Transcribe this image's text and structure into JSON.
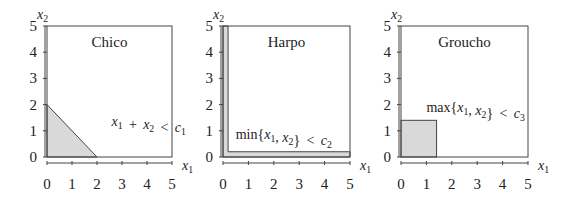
{
  "chart_data": [
    {
      "type": "area",
      "title": "Chico",
      "xlabel": "x1",
      "ylabel": "x2",
      "xlim": [
        0,
        5
      ],
      "ylim": [
        0,
        5
      ],
      "xticks": [
        "0",
        "1",
        "2",
        "3",
        "4",
        "5"
      ],
      "yticks": [
        "0",
        "1",
        "2",
        "3",
        "4",
        "5"
      ],
      "region": {
        "shape": "triangle",
        "points": [
          [
            0,
            0
          ],
          [
            2,
            0
          ],
          [
            0,
            2
          ]
        ]
      },
      "annotation": {
        "text": "x1 + x2 < c1",
        "at": [
          2.5,
          1.2
        ]
      }
    },
    {
      "type": "area",
      "title": "Harpo",
      "xlabel": "x1",
      "ylabel": "x2",
      "xlim": [
        0,
        5
      ],
      "ylim": [
        0,
        5
      ],
      "xticks": [
        "0",
        "1",
        "2",
        "3",
        "4",
        "5"
      ],
      "yticks": [
        "0",
        "1",
        "2",
        "3",
        "4",
        "5"
      ],
      "region": {
        "shape": "L-band",
        "thickness": 0.2
      },
      "annotation": {
        "text": "min{x1, x2} < c2",
        "at": [
          0.5,
          0.5
        ]
      }
    },
    {
      "type": "area",
      "title": "Groucho",
      "xlabel": "x1",
      "ylabel": "x2",
      "xlim": [
        0,
        5
      ],
      "ylim": [
        0,
        5
      ],
      "xticks": [
        "0",
        "1",
        "2",
        "3",
        "4",
        "5"
      ],
      "yticks": [
        "0",
        "1",
        "2",
        "3",
        "4",
        "5"
      ],
      "region": {
        "shape": "square",
        "size": 1.4
      },
      "annotation": {
        "text": "max{x1, x2} < c3",
        "at": [
          1.0,
          1.7
        ]
      }
    }
  ],
  "colors": {
    "fill": "#d9d9d9",
    "stroke": "#444444",
    "text": "#222222"
  }
}
